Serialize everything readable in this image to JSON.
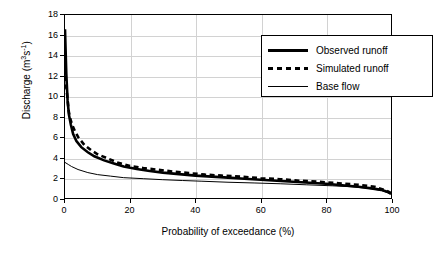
{
  "chart_data": {
    "type": "line",
    "title": "",
    "xlabel": "Probability of exceedance (%)",
    "ylabel": "Discharge (m3s-1)",
    "ylabel_base": "Discharge (m",
    "ylabel_sup1": "3",
    "ylabel_mid": "s",
    "ylabel_sup2": "-1",
    "ylabel_end": ")",
    "xlim": [
      0,
      100
    ],
    "ylim": [
      0,
      18
    ],
    "grid": "vertical-and-horizontal-light",
    "legend_position": "top-right-inside",
    "yticks": [
      0,
      2,
      4,
      6,
      8,
      10,
      12,
      14,
      16,
      18
    ],
    "xticks": [
      0,
      20,
      40,
      60,
      80,
      100
    ],
    "series": [
      {
        "name": "Observed runoff",
        "style": "thick-solid",
        "color": "#000000",
        "x": [
          0,
          0.4,
          0.8,
          1.2,
          1.8,
          2.5,
          3.5,
          5,
          7,
          9,
          12,
          15,
          18,
          22,
          26,
          30,
          35,
          40,
          45,
          50,
          55,
          60,
          65,
          70,
          75,
          80,
          85,
          90,
          94,
          97,
          99,
          100
        ],
        "y": [
          16.6,
          12.2,
          9.6,
          8.2,
          7.2,
          6.3,
          5.6,
          5.0,
          4.5,
          4.1,
          3.7,
          3.4,
          3.1,
          2.85,
          2.65,
          2.5,
          2.35,
          2.2,
          2.1,
          2.0,
          1.9,
          1.8,
          1.7,
          1.6,
          1.5,
          1.4,
          1.25,
          1.1,
          0.95,
          0.8,
          0.6,
          0.4
        ]
      },
      {
        "name": "Simulated runoff",
        "style": "dashed",
        "color": "#000000",
        "x": [
          0,
          0.3,
          0.7,
          1.1,
          1.6,
          2.2,
          3.0,
          4.2,
          6,
          8,
          10,
          13,
          16,
          20,
          24,
          28,
          33,
          38,
          43,
          48,
          54,
          60,
          66,
          72,
          78,
          84,
          90,
          95,
          98,
          100
        ],
        "y": [
          12.0,
          11.2,
          10.0,
          8.6,
          7.8,
          7.2,
          6.6,
          5.9,
          5.2,
          4.7,
          4.3,
          3.9,
          3.5,
          3.15,
          2.95,
          2.8,
          2.6,
          2.45,
          2.3,
          2.2,
          2.1,
          1.95,
          1.85,
          1.7,
          1.6,
          1.45,
          1.3,
          1.1,
          0.8,
          0.5
        ]
      },
      {
        "name": "Base flow",
        "style": "thin-solid",
        "color": "#000000",
        "x": [
          0,
          1,
          2,
          4,
          7,
          10,
          14,
          18,
          24,
          30,
          36,
          42,
          50,
          58,
          66,
          74,
          82,
          88,
          93,
          97,
          100
        ],
        "y": [
          3.5,
          3.3,
          3.1,
          2.8,
          2.5,
          2.3,
          2.15,
          2.0,
          1.9,
          1.8,
          1.72,
          1.65,
          1.55,
          1.48,
          1.4,
          1.3,
          1.2,
          1.1,
          0.95,
          0.75,
          0.4
        ]
      }
    ],
    "legend": [
      "Observed runoff",
      "Simulated runoff",
      "Base flow"
    ]
  }
}
